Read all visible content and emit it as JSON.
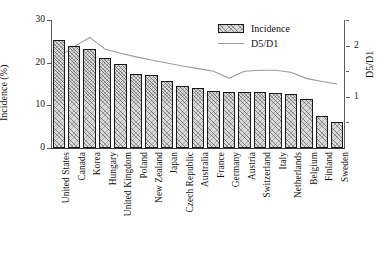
{
  "chart_data": {
    "type": "bar",
    "title": "",
    "xlabel": "",
    "ylabel": "Incidence (%)",
    "y2label": "D5/D1",
    "ylim": [
      0,
      30
    ],
    "y2lim": [
      0,
      2.5
    ],
    "yticks": [
      0,
      10,
      20,
      30
    ],
    "y2ticks": [
      1,
      2
    ],
    "y2ticks_minor": [
      0.5,
      1.5,
      2.5
    ],
    "grid": false,
    "legend_position": "top-right",
    "categories": [
      "United States",
      "Canada",
      "Korea",
      "Hungary",
      "United Kingdom",
      "Poland",
      "New Zealand",
      "Japan",
      "Czech Republic",
      "Australia",
      "France",
      "Germany",
      "Austria",
      "Switzerland",
      "Italy",
      "Netherlands",
      "Belgium",
      "Finland",
      "Sweden"
    ],
    "series": [
      {
        "name": "Incidence",
        "type": "bar",
        "axis": "left",
        "unit": "%",
        "values": [
          25.2,
          23.9,
          23.3,
          21.2,
          19.6,
          17.4,
          17.0,
          15.7,
          14.5,
          14.0,
          13.4,
          13.2,
          13.1,
          13.1,
          13.0,
          12.6,
          11.6,
          7.5,
          6.2
        ]
      },
      {
        "name": "D5/D1",
        "type": "line",
        "axis": "right",
        "values": [
          1.78,
          1.98,
          2.16,
          1.93,
          1.85,
          1.78,
          1.72,
          1.66,
          1.6,
          1.55,
          1.5,
          1.36,
          1.5,
          1.52,
          1.52,
          1.48,
          1.36,
          1.3,
          1.25
        ]
      }
    ]
  },
  "legend": {
    "items": [
      {
        "label": "Incidence",
        "marker": "hatched-bar-swatch",
        "color": "#d9d9d9"
      },
      {
        "label": "D5/D1",
        "marker": "line-swatch",
        "color": "#9a9a9a"
      }
    ]
  },
  "colors": {
    "bar_fill": "#d9d9d9",
    "bar_edge": "#1a1a1a",
    "line": "#9a9a9a",
    "axis": "#5a5a5a",
    "text": "#111111",
    "background": "#ffffff"
  }
}
